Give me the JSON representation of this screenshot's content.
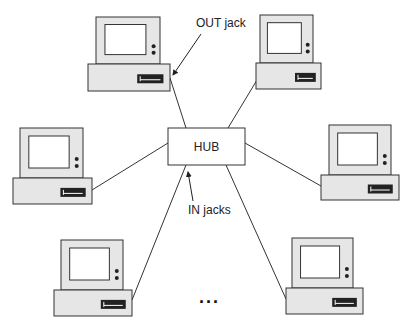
{
  "diagram": {
    "hub": {
      "label": "HUB",
      "x": 168,
      "y": 128,
      "w": 77,
      "h": 37
    },
    "labels": {
      "out_jack": "OUT jack",
      "in_jacks": "IN jacks",
      "ellipsis": "..."
    },
    "colors": {
      "stroke": "#333333",
      "case_fill": "#e6e6e6",
      "screen_fill": "#ffffff",
      "slot_fill": "#222222"
    },
    "computers": [
      {
        "id": "top-left",
        "mx": 96,
        "my": 17,
        "mw": 64,
        "mh": 47,
        "bx": 88,
        "by": 64,
        "bw": 82,
        "bh": 27,
        "jack": [
          170,
          78
        ]
      },
      {
        "id": "top-right",
        "mx": 260,
        "my": 15,
        "mw": 53,
        "mh": 48,
        "bx": 256,
        "by": 63,
        "bw": 65,
        "bh": 26,
        "jack": [
          257,
          80
        ]
      },
      {
        "id": "mid-left",
        "mx": 20,
        "my": 128,
        "mw": 63,
        "mh": 50,
        "bx": 13,
        "by": 178,
        "bw": 79,
        "bh": 26,
        "jack": [
          92,
          190
        ]
      },
      {
        "id": "mid-right",
        "mx": 329,
        "my": 125,
        "mw": 62,
        "mh": 50,
        "bx": 321,
        "by": 175,
        "bw": 78,
        "bh": 25,
        "jack": [
          321,
          186
        ]
      },
      {
        "id": "bottom-left",
        "mx": 61,
        "my": 240,
        "mw": 62,
        "mh": 50,
        "bx": 54,
        "by": 290,
        "bw": 78,
        "bh": 26,
        "jack": [
          132,
          300
        ]
      },
      {
        "id": "bottom-right",
        "mx": 292,
        "my": 238,
        "mw": 61,
        "mh": 50,
        "bx": 286,
        "by": 288,
        "bw": 77,
        "bh": 26,
        "jack": [
          286,
          299
        ]
      }
    ],
    "links": [
      {
        "from": [
          170,
          78
        ],
        "to": [
          186,
          128
        ]
      },
      {
        "from": [
          257,
          80
        ],
        "to": [
          228,
          128
        ]
      },
      {
        "from": [
          92,
          190
        ],
        "to": [
          168,
          143
        ]
      },
      {
        "from": [
          321,
          186
        ],
        "to": [
          245,
          143
        ]
      },
      {
        "from": [
          132,
          300
        ],
        "to": [
          186,
          165
        ]
      },
      {
        "from": [
          286,
          299
        ],
        "to": [
          226,
          165
        ]
      }
    ]
  }
}
